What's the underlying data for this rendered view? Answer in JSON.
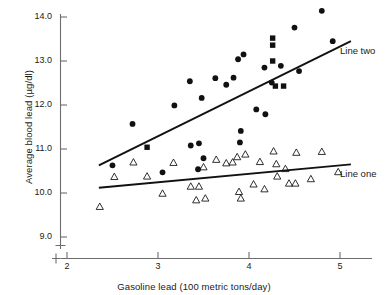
{
  "chart_data": {
    "type": "scatter",
    "title": "",
    "xlabel": "Gasoline lead (100 metric tons/day)",
    "ylabel": "Average blood lead (µg/dl)",
    "xlim": [
      1.85,
      5.25
    ],
    "ylim": [
      8.75,
      14.35
    ],
    "xticks": [
      "2",
      "3",
      "4",
      "5"
    ],
    "xtick_values": [
      2,
      3,
      4,
      5
    ],
    "yticks": [
      "9.0",
      "10.0",
      "11.0",
      "12.0",
      "13.0",
      "14.0"
    ],
    "ytick_values": [
      9.0,
      10.0,
      11.0,
      12.0,
      13.0,
      14.0
    ],
    "grid": false,
    "axis_break_x": true,
    "axis_break_y": true,
    "legend_position": "inline-right",
    "series": [
      {
        "name": "Line one",
        "marker": "open-triangle",
        "color": "#1a1a1a",
        "label": "Line one",
        "points": [
          [
            2.36,
            9.69
          ],
          [
            2.52,
            10.37
          ],
          [
            2.73,
            10.7
          ],
          [
            2.88,
            10.38
          ],
          [
            3.05,
            9.99
          ],
          [
            3.17,
            10.69
          ],
          [
            3.36,
            10.15
          ],
          [
            3.42,
            9.84
          ],
          [
            3.45,
            10.15
          ],
          [
            3.5,
            10.59
          ],
          [
            3.52,
            9.88
          ],
          [
            3.64,
            10.76
          ],
          [
            3.75,
            10.68
          ],
          [
            3.82,
            10.7
          ],
          [
            3.87,
            10.82
          ],
          [
            3.89,
            10.03
          ],
          [
            3.91,
            9.88
          ],
          [
            3.96,
            10.88
          ],
          [
            4.05,
            10.2
          ],
          [
            4.12,
            10.71
          ],
          [
            4.17,
            10.09
          ],
          [
            4.27,
            10.95
          ],
          [
            4.3,
            10.66
          ],
          [
            4.31,
            10.38
          ],
          [
            4.4,
            10.55
          ],
          [
            4.44,
            10.22
          ],
          [
            4.51,
            10.22
          ],
          [
            4.52,
            10.92
          ],
          [
            4.68,
            10.32
          ],
          [
            4.8,
            10.94
          ],
          [
            4.98,
            10.48
          ]
        ],
        "fit_line": {
          "x0": 2.35,
          "y0": 10.12,
          "x1": 5.12,
          "y1": 10.65
        }
      },
      {
        "name": "Line two",
        "marker": "filled-circle",
        "color": "#111111",
        "label": "Line two",
        "points": [
          [
            2.5,
            10.63
          ],
          [
            2.72,
            11.57
          ],
          [
            3.05,
            10.47
          ],
          [
            3.18,
            11.99
          ],
          [
            3.35,
            12.54
          ],
          [
            3.36,
            11.08
          ],
          [
            3.44,
            10.54
          ],
          [
            3.45,
            11.13
          ],
          [
            3.48,
            12.16
          ],
          [
            3.5,
            10.79
          ],
          [
            3.63,
            12.61
          ],
          [
            3.75,
            12.46
          ],
          [
            3.83,
            12.62
          ],
          [
            3.88,
            13.04
          ],
          [
            3.9,
            11.15
          ],
          [
            3.91,
            11.41
          ],
          [
            3.94,
            13.15
          ],
          [
            4.08,
            11.9
          ],
          [
            4.17,
            12.85
          ],
          [
            4.18,
            11.79
          ],
          [
            4.25,
            12.51
          ],
          [
            4.35,
            12.89
          ],
          [
            4.5,
            13.76
          ],
          [
            4.55,
            12.77
          ],
          [
            4.8,
            14.14
          ],
          [
            4.92,
            13.45
          ]
        ],
        "fit_line": {
          "x0": 2.35,
          "y0": 10.63,
          "x1": 5.12,
          "y1": 13.45
        }
      },
      {
        "name": "Line two squares",
        "marker": "filled-square",
        "color": "#111111",
        "label": "",
        "points": [
          [
            2.88,
            11.04
          ],
          [
            4.26,
            13.52
          ],
          [
            4.26,
            13.36
          ],
          [
            4.26,
            13.0
          ],
          [
            4.29,
            12.43
          ],
          [
            4.38,
            12.43
          ]
        ]
      }
    ]
  },
  "labels": {
    "line_two": "Line two",
    "line_one": "Line one"
  }
}
